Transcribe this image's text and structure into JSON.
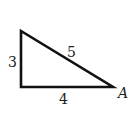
{
  "diagram": {
    "type": "right-triangle",
    "sides": {
      "vertical": "3",
      "hypotenuse": "5",
      "horizontal": "4"
    },
    "vertex_label": "A",
    "stroke_color": "#111111"
  }
}
